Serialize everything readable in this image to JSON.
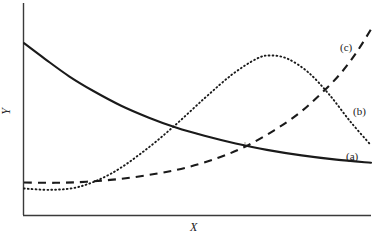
{
  "chart_data": {
    "type": "line",
    "title": "",
    "xlabel": "X",
    "ylabel": "Y",
    "grid": false,
    "legend_position": "inline-right",
    "axis_ranges": {
      "x": [
        0,
        1
      ],
      "y": [
        0,
        1
      ]
    },
    "series": [
      {
        "name": "(a)",
        "style": "solid",
        "description": "monotonically decreasing convex decay curve",
        "color": "#1a1a1a",
        "points": [
          [
            0.0,
            0.885
          ],
          [
            0.06,
            0.8
          ],
          [
            0.13,
            0.705
          ],
          [
            0.2,
            0.625
          ],
          [
            0.28,
            0.545
          ],
          [
            0.36,
            0.48
          ],
          [
            0.44,
            0.425
          ],
          [
            0.52,
            0.382
          ],
          [
            0.61,
            0.34
          ],
          [
            0.7,
            0.305
          ],
          [
            0.8,
            0.275
          ],
          [
            0.9,
            0.252
          ],
          [
            1.0,
            0.235
          ]
        ]
      },
      {
        "name": "(b)",
        "style": "dotted",
        "description": "unimodal hump peaking near x=0.70",
        "color": "#1a1a1a",
        "points": [
          [
            0.0,
            0.095
          ],
          [
            0.08,
            0.088
          ],
          [
            0.16,
            0.105
          ],
          [
            0.25,
            0.175
          ],
          [
            0.34,
            0.29
          ],
          [
            0.43,
            0.43
          ],
          [
            0.52,
            0.585
          ],
          [
            0.6,
            0.715
          ],
          [
            0.67,
            0.8
          ],
          [
            0.71,
            0.818
          ],
          [
            0.76,
            0.8
          ],
          [
            0.82,
            0.725
          ],
          [
            0.88,
            0.605
          ],
          [
            0.94,
            0.46
          ],
          [
            1.0,
            0.33
          ]
        ]
      },
      {
        "name": "(c)",
        "style": "dashed",
        "description": "monotonically increasing convex growth curve",
        "color": "#1a1a1a",
        "points": [
          [
            0.0,
            0.128
          ],
          [
            0.09,
            0.126
          ],
          [
            0.18,
            0.132
          ],
          [
            0.28,
            0.148
          ],
          [
            0.38,
            0.175
          ],
          [
            0.47,
            0.21
          ],
          [
            0.56,
            0.262
          ],
          [
            0.64,
            0.325
          ],
          [
            0.72,
            0.41
          ],
          [
            0.79,
            0.5
          ],
          [
            0.85,
            0.6
          ],
          [
            0.91,
            0.715
          ],
          [
            0.96,
            0.84
          ],
          [
            1.0,
            0.96
          ]
        ]
      }
    ],
    "annotations": [
      {
        "text": "(c)",
        "series": "(c)",
        "position": "upper-right"
      },
      {
        "text": "(b)",
        "series": "(b)",
        "position": "mid-right"
      },
      {
        "text": "(a)",
        "series": "(a)",
        "position": "lower-right"
      }
    ]
  },
  "axes": {
    "x_title": "X",
    "y_title": "Y"
  },
  "labels": {
    "a": "(a)",
    "b": "(b)",
    "c": "(c)"
  },
  "colors": {
    "ink": "#1a1a1a",
    "axis": "#3a3a3a",
    "background": "#ffffff"
  }
}
